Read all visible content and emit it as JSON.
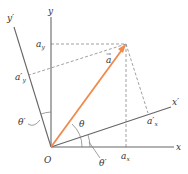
{
  "diagram": {
    "origin_label": "O",
    "axes": {
      "x": "x",
      "y": "y",
      "x_prime": "x′",
      "y_prime": "y′"
    },
    "vector": {
      "label": "a",
      "arrow": "→",
      "color": "#f08a4b"
    },
    "components": {
      "ax": {
        "base": "a",
        "sub": "x"
      },
      "ay": {
        "base": "a",
        "sub": "y"
      },
      "ax_prime": {
        "base": "a′",
        "sub": "x"
      },
      "ay_prime": {
        "base": "a′",
        "sub": "y"
      }
    },
    "angles": {
      "theta": "θ",
      "theta_prime_1": "θ′",
      "theta_prime_2": "θ′"
    },
    "colors": {
      "axis": "#666666",
      "dashed": "#888888",
      "vector": "#f08a4b",
      "text": "#333333"
    }
  }
}
